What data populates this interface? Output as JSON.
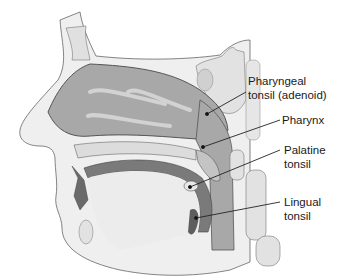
{
  "diagram": {
    "labels": [
      {
        "id": "pharyngeal",
        "line1": "Pharyngeal",
        "line2": "tonsil (adenoid)"
      },
      {
        "id": "pharynx",
        "line1": "Pharynx",
        "line2": ""
      },
      {
        "id": "palatine",
        "line1": "Palatine",
        "line2": "tonsil"
      },
      {
        "id": "lingual",
        "line1": "Lingual",
        "line2": "tonsil"
      }
    ],
    "colors": {
      "cavity": "#a9a9a9",
      "mucosa": "#c8c8c8",
      "bone": "#e6e6e6",
      "tonsil_dark": "#6e6e6e",
      "outline": "#555555",
      "skin": "#efefef"
    }
  }
}
